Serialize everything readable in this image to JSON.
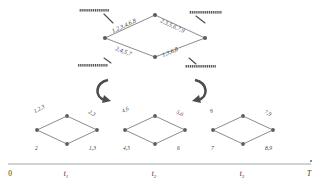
{
  "figure": {
    "type": "lattice-decomposition-diagram",
    "background": "#ffffff",
    "ink_color": "#4a4a50",
    "edge_color": "#6f6f75"
  },
  "product_lattice": {
    "name": "product-diamond",
    "nodes": [
      {
        "id": "left",
        "cx": 105,
        "cy": 38
      },
      {
        "id": "top",
        "cx": 155,
        "cy": 15
      },
      {
        "id": "right",
        "cx": 205,
        "cy": 38
      },
      {
        "id": "bottom",
        "cx": 155,
        "cy": 57
      }
    ],
    "edges": [
      {
        "from": "left",
        "to": "top",
        "label": "1,2,3,4,6,8",
        "label_x": 113,
        "label_y": 33,
        "rotate": -25
      },
      {
        "from": "top",
        "to": "right",
        "label": "2,3,5,6,7,9",
        "label_x": 160,
        "label_y": 22,
        "rotate": 25
      },
      {
        "from": "left",
        "to": "bottom",
        "label": "2,4,5,7",
        "label_x": 115,
        "label_y": 50,
        "rotate": 21
      },
      {
        "from": "bottom",
        "to": "right",
        "label": "1,3,6,8",
        "label_x": 163,
        "label_y": 57,
        "rotate": -23
      }
    ],
    "hatched_bars": [
      {
        "id": "bar-top-left",
        "x": 79,
        "y": 9,
        "w": 30,
        "h": 2.6,
        "pointer": [
          [
            104,
            14
          ],
          [
            113,
            23
          ]
        ]
      },
      {
        "id": "bar-top-right",
        "x": 189,
        "y": 11,
        "w": 33,
        "h": 2.6,
        "pointer": [
          [
            205,
            23
          ],
          [
            196,
            16
          ]
        ]
      },
      {
        "id": "bar-bottom-left",
        "x": 78,
        "y": 64,
        "w": 30,
        "h": 2.6,
        "pointer": [
          [
            104,
            58
          ],
          [
            111,
            63
          ]
        ]
      },
      {
        "id": "bar-bottom-right",
        "x": 185,
        "y": 65,
        "w": 31,
        "h": 2.6,
        "pointer": [
          [
            189,
            58
          ],
          [
            196,
            64
          ]
        ]
      }
    ]
  },
  "decomposition_arrows": [
    {
      "id": "arrow-left",
      "direction": "clockwise-down-right"
    },
    {
      "id": "arrow-right",
      "direction": "counterclockwise-down-left"
    }
  ],
  "component_lattices": [
    {
      "name": "diamond-t1",
      "center_x": 67,
      "nodes": [
        {
          "id": "left",
          "dx": -30,
          "dy": 0
        },
        {
          "id": "top",
          "dx": 0,
          "dy": -14
        },
        {
          "id": "right",
          "dx": 30,
          "dy": 0
        },
        {
          "id": "bottom",
          "dx": 0,
          "dy": 14
        }
      ],
      "edges": [
        {
          "from": "left",
          "to": "top",
          "label": "1,2,3"
        },
        {
          "from": "top",
          "to": "right",
          "label": "2,3"
        },
        {
          "from": "left",
          "to": "bottom",
          "label": "2"
        },
        {
          "from": "bottom",
          "to": "right",
          "label": "1,3"
        }
      ]
    },
    {
      "name": "diamond-t2",
      "center_x": 155,
      "nodes": [
        {
          "id": "left",
          "dx": -30,
          "dy": 0
        },
        {
          "id": "top",
          "dx": 0,
          "dy": -14
        },
        {
          "id": "right",
          "dx": 30,
          "dy": 0
        },
        {
          "id": "bottom",
          "dx": 0,
          "dy": 14
        }
      ],
      "edges": [
        {
          "from": "left",
          "to": "top",
          "label": "4,6"
        },
        {
          "from": "top",
          "to": "right",
          "label": "5,6"
        },
        {
          "from": "left",
          "to": "bottom",
          "label": "4,5"
        },
        {
          "from": "bottom",
          "to": "right",
          "label": "6"
        }
      ]
    },
    {
      "name": "diamond-t3",
      "center_x": 243,
      "nodes": [
        {
          "id": "left",
          "dx": -30,
          "dy": 0
        },
        {
          "id": "top",
          "dx": 0,
          "dy": -14
        },
        {
          "id": "right",
          "dx": 30,
          "dy": 0
        },
        {
          "id": "bottom",
          "dx": 0,
          "dy": 14
        }
      ],
      "edges": [
        {
          "from": "left",
          "to": "top",
          "label": "8"
        },
        {
          "from": "top",
          "to": "right",
          "label": "7,9"
        },
        {
          "from": "left",
          "to": "bottom",
          "label": "7"
        },
        {
          "from": "bottom",
          "to": "right",
          "label": "8,9"
        }
      ]
    }
  ],
  "timeline": {
    "name": "time-axis",
    "y": 164,
    "x_start": 8,
    "x_end": 311,
    "ticks": [
      {
        "label": "0",
        "italic": false,
        "sub": "",
        "x": 10
      },
      {
        "label": "t",
        "italic": true,
        "sub": "1",
        "x": 66
      },
      {
        "label": "t",
        "italic": true,
        "sub": "2",
        "x": 154
      },
      {
        "label": "t",
        "italic": true,
        "sub": "3",
        "x": 242
      },
      {
        "label": "T",
        "italic": true,
        "sub": "",
        "x": 309
      }
    ],
    "end_marker": {
      "cx": 311,
      "cy": 161,
      "r": 1.1
    }
  }
}
